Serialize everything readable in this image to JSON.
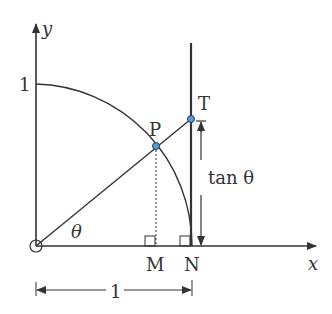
{
  "diagram": {
    "axis_x_label": "x",
    "axis_y_label": "y",
    "y_tick_label": "1",
    "point_P": "P",
    "point_T": "T",
    "point_M": "M",
    "point_N": "N",
    "angle_label": "θ",
    "tan_label": "tan θ",
    "length_label": "1",
    "colors": {
      "line": "#333333",
      "point_fill": "#5b9bd5",
      "point_stroke": "#1f3f66"
    }
  }
}
